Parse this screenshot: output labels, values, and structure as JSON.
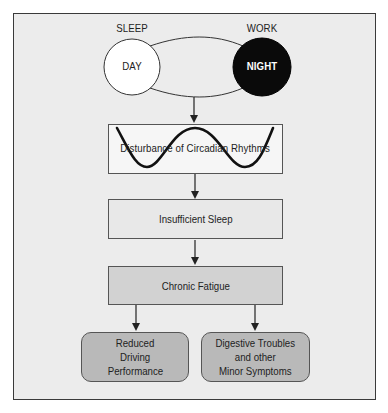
{
  "diagram": {
    "top": {
      "left_label": "SLEEP",
      "right_label": "WORK",
      "left_circle": "DAY",
      "right_circle": "NIGHT"
    },
    "steps": [
      {
        "label": "Disturbance of Circadian Rhythms",
        "fill": "#f6f6f6",
        "icon": "sine-wave-icon"
      },
      {
        "label": "Insufficient Sleep",
        "fill": "#e8e8e8"
      },
      {
        "label": "Chronic Fatigue",
        "fill": "#d2d2d2"
      }
    ],
    "outcomes": [
      {
        "line1": "Reduced",
        "line2": "Driving",
        "line3": "Performance",
        "fill": "#b9b9b9"
      },
      {
        "line1": "Digestive Troubles",
        "line2": "and other",
        "line3": "Minor Symptoms",
        "fill": "#b9b9b9"
      }
    ],
    "colors": {
      "background": "#ececec",
      "line": "#222222",
      "night_fill": "#0a0a0a",
      "day_fill": "#ffffff"
    }
  }
}
